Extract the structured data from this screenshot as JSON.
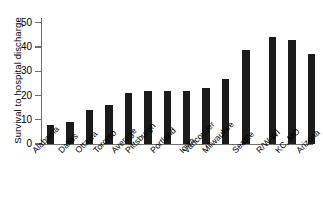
{
  "chart_data": {
    "type": "bar",
    "title": "",
    "xlabel": "",
    "ylabel": "Survival  to hospital discharge",
    "categories": [
      "Alabama",
      "Dallas",
      "Ottawa",
      "Toronto",
      "Average",
      "Pittsburgh",
      "Portland",
      "Iowa",
      "Vancouver",
      "Milwaukee",
      "Seattle",
      "R/W WI",
      "KC, MO",
      "Arizona"
    ],
    "values": [
      8,
      9,
      14,
      16,
      21,
      22,
      22,
      22,
      23,
      27,
      39,
      44,
      43,
      37
    ],
    "ylim": [
      0,
      52
    ],
    "yticks": [
      0,
      10,
      20,
      30,
      40,
      50
    ],
    "ytick_labels": [
      "0",
      "10",
      "20",
      "30",
      "40",
      "50"
    ],
    "grid": false,
    "legend": false,
    "bar_color": "#1b1b1b",
    "axis_color": "#6f6f6f",
    "background": "#ffffff"
  }
}
